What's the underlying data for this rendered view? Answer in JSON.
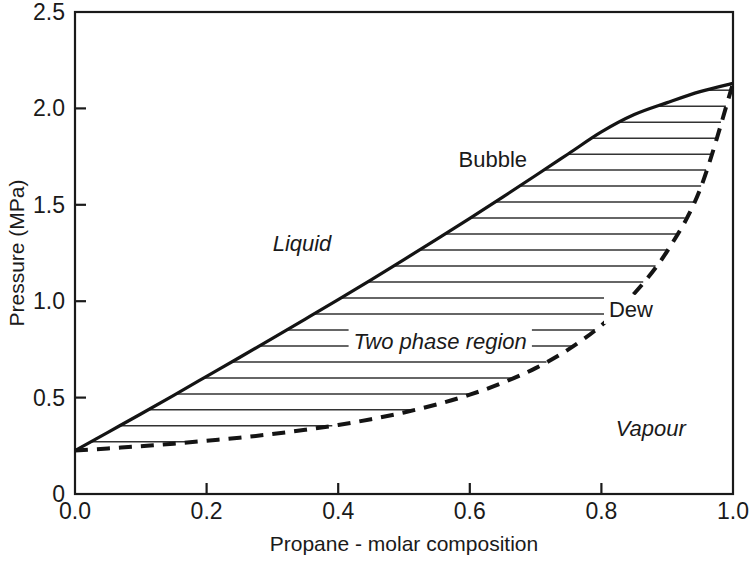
{
  "chart_data": {
    "type": "line",
    "title": "",
    "subtitle": "",
    "xlabel": "Propane - molar composition",
    "ylabel": "Pressure (MPa)",
    "xlim": [
      0.0,
      1.0
    ],
    "ylim": [
      0.0,
      2.5
    ],
    "grid": false,
    "legend_position": "none",
    "xticks": [
      "0.0",
      "0.2",
      "0.4",
      "0.6",
      "0.8",
      "1.0"
    ],
    "xtick_values": [
      0.0,
      0.2,
      0.4,
      0.6,
      0.8,
      1.0
    ],
    "yticks": [
      "0",
      "0.5",
      "1.0",
      "1.5",
      "2.0",
      "2.5"
    ],
    "ytick_values": [
      0.0,
      0.5,
      1.0,
      1.5,
      2.0,
      2.5
    ],
    "series": [
      {
        "name": "Bubble",
        "style": "solid",
        "linewidth": 3.2,
        "color": "#141414",
        "x": [
          0.0,
          0.05,
          0.1,
          0.15,
          0.2,
          0.25,
          0.3,
          0.35,
          0.4,
          0.45,
          0.5,
          0.55,
          0.6,
          0.65,
          0.7,
          0.75,
          0.8,
          0.85,
          0.9,
          0.95,
          1.0
        ],
        "values": [
          0.225,
          0.32,
          0.415,
          0.512,
          0.61,
          0.708,
          0.807,
          0.907,
          1.008,
          1.111,
          1.216,
          1.322,
          1.43,
          1.54,
          1.652,
          1.765,
          1.878,
          1.968,
          2.03,
          2.087,
          2.13
        ]
      },
      {
        "name": "Dew",
        "style": "dashed",
        "linewidth": 4.0,
        "color": "#141414",
        "x": [
          0.0,
          0.05,
          0.1,
          0.15,
          0.2,
          0.25,
          0.3,
          0.35,
          0.4,
          0.45,
          0.5,
          0.55,
          0.6,
          0.65,
          0.7,
          0.75,
          0.8,
          0.85,
          0.9,
          0.95,
          1.0
        ],
        "values": [
          0.225,
          0.236,
          0.248,
          0.261,
          0.276,
          0.292,
          0.311,
          0.333,
          0.358,
          0.388,
          0.423,
          0.465,
          0.515,
          0.577,
          0.653,
          0.75,
          0.875,
          1.04,
          1.26,
          1.58,
          2.13
        ]
      }
    ],
    "annotations": [
      {
        "text": "Bubble",
        "x": 0.635,
        "y": 1.74,
        "style": "upright"
      },
      {
        "text": "Dew",
        "x": 0.845,
        "y": 0.96,
        "style": "upright"
      },
      {
        "text": "Liquid",
        "x": 0.345,
        "y": 1.3,
        "style": "italic"
      },
      {
        "text": "Two phase region",
        "x": 0.555,
        "y": 0.795,
        "style": "italic"
      },
      {
        "text": "Vapour",
        "x": 0.875,
        "y": 0.345,
        "style": "italic"
      }
    ],
    "shaded_region": {
      "label": "Two phase region",
      "hatch": "horizontal",
      "hatch_spacing_mpa": 0.0829,
      "bounded_by": [
        "Bubble",
        "Dew"
      ]
    }
  },
  "colors": {
    "background": "#ffffff",
    "ink": "#1a1a1a",
    "curve": "#141414",
    "hatch": "#333333"
  }
}
